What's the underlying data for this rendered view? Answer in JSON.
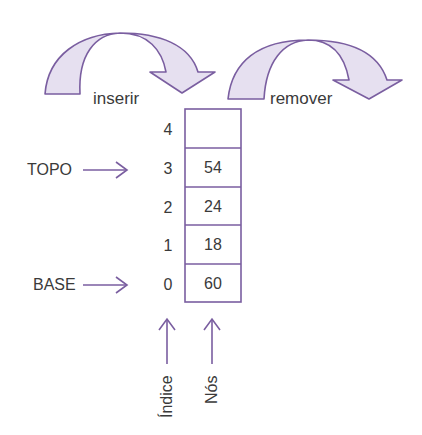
{
  "colors": {
    "stroke": "#7a5ea0",
    "fill": "#e6e0f0",
    "text": "#3a3a3a"
  },
  "operations": {
    "insert_label": "inserir",
    "remove_label": "remover"
  },
  "pointers": {
    "top_label": "TOPO",
    "base_label": "BASE",
    "top_index": 3,
    "base_index": 0
  },
  "stack": {
    "indices": [
      "4",
      "3",
      "2",
      "1",
      "0"
    ],
    "nodes": [
      "",
      "54",
      "24",
      "18",
      "60"
    ]
  },
  "axis_labels": {
    "index_label": "Índice",
    "nodes_label": "Nós"
  }
}
